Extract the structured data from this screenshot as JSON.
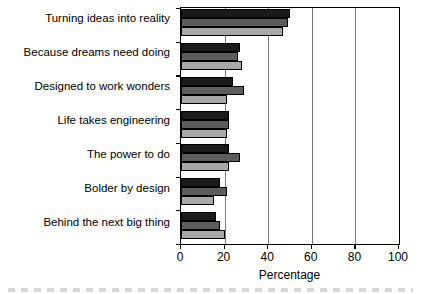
{
  "chart_data": {
    "type": "bar",
    "orientation": "horizontal",
    "title": "",
    "subtitle": "",
    "xlabel": "Percentage",
    "ylabel": "",
    "xlim": [
      0,
      100
    ],
    "xticks": [
      0,
      20,
      40,
      60,
      80,
      100
    ],
    "xticklabels": [
      "0",
      "20",
      "40",
      "60",
      "80",
      "100"
    ],
    "grid": "vertical",
    "legend": "none",
    "categories": [
      "Turning ideas into reality",
      "Because dreams need doing",
      "Designed to work wonders",
      "Life takes engineering",
      "The power to do",
      "Bolder by design",
      "Behind the next big thing"
    ],
    "series": [
      {
        "name": "series-1",
        "color": "#1a1a1a",
        "values": [
          50,
          27,
          24,
          22,
          22,
          18,
          16
        ]
      },
      {
        "name": "series-2",
        "color": "#5c5c5c",
        "values": [
          49,
          26,
          29,
          22,
          27,
          21,
          18
        ]
      },
      {
        "name": "series-3",
        "color": "#a8a8a8",
        "values": [
          47,
          28,
          21,
          21,
          22,
          15,
          20
        ]
      }
    ]
  },
  "axis": {
    "x_title": "Percentage"
  }
}
